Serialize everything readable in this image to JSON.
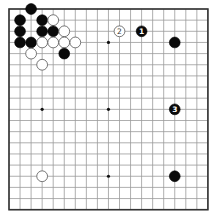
{
  "board": {
    "size": 19,
    "origin_x": 9,
    "origin_y": 9,
    "spacing_x": 11.05,
    "spacing_y": 11.15,
    "colors": {
      "grid": "#9a9a9a",
      "border": "#333333",
      "black": "#0a0a0a",
      "white": "#ffffff"
    },
    "star_points": [
      [
        3,
        3
      ],
      [
        9,
        3
      ],
      [
        15,
        3
      ],
      [
        3,
        9
      ],
      [
        9,
        9
      ],
      [
        15,
        9
      ],
      [
        3,
        15
      ],
      [
        9,
        15
      ],
      [
        15,
        15
      ]
    ],
    "stones": [
      {
        "color": "black",
        "col": 2,
        "row": 0,
        "label": ""
      },
      {
        "color": "black",
        "col": 1,
        "row": 1,
        "label": ""
      },
      {
        "color": "black",
        "col": 3,
        "row": 1,
        "label": ""
      },
      {
        "color": "white",
        "col": 4,
        "row": 1,
        "label": ""
      },
      {
        "color": "black",
        "col": 1,
        "row": 2,
        "label": ""
      },
      {
        "color": "black",
        "col": 3,
        "row": 2,
        "label": ""
      },
      {
        "color": "black",
        "col": 4,
        "row": 2,
        "label": ""
      },
      {
        "color": "white",
        "col": 5,
        "row": 2,
        "label": ""
      },
      {
        "color": "black",
        "col": 1,
        "row": 3,
        "label": ""
      },
      {
        "color": "black",
        "col": 2,
        "row": 3,
        "label": ""
      },
      {
        "color": "white",
        "col": 3,
        "row": 3,
        "label": ""
      },
      {
        "color": "white",
        "col": 4,
        "row": 3,
        "label": ""
      },
      {
        "color": "white",
        "col": 5,
        "row": 3,
        "label": ""
      },
      {
        "color": "white",
        "col": 6,
        "row": 3,
        "label": ""
      },
      {
        "color": "white",
        "col": 2,
        "row": 4,
        "label": ""
      },
      {
        "color": "black",
        "col": 5,
        "row": 4,
        "label": ""
      },
      {
        "color": "white",
        "col": 3,
        "row": 5,
        "label": ""
      },
      {
        "color": "white",
        "col": 10,
        "row": 2,
        "label": "2"
      },
      {
        "color": "black",
        "col": 12,
        "row": 2,
        "label": "1"
      },
      {
        "color": "black",
        "col": 15,
        "row": 3,
        "label": ""
      },
      {
        "color": "black",
        "col": 15,
        "row": 9,
        "label": "3"
      },
      {
        "color": "white",
        "col": 3,
        "row": 15,
        "label": ""
      },
      {
        "color": "black",
        "col": 15,
        "row": 15,
        "label": ""
      }
    ]
  }
}
